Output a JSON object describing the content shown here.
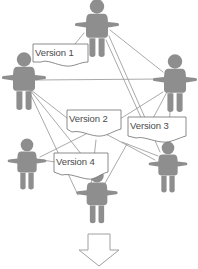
{
  "diagram": {
    "background_color": "#ffffff",
    "person_color": "#8e8e8e",
    "line_color": "#9a9a9a",
    "callout_fill": "#ffffff",
    "callout_stroke": "#6f6f6f",
    "text_color": "#4a4a4a",
    "arrow_fill": "#ffffff",
    "arrow_stroke": "#a0a0a0"
  },
  "callouts": [
    {
      "id": "version-1",
      "label": "Version 1",
      "x": 33,
      "y": 44
    },
    {
      "id": "version-2",
      "label": "Version 2",
      "x": 67,
      "y": 117
    },
    {
      "id": "version-3",
      "label": "Version 3",
      "x": 128,
      "y": 124
    },
    {
      "id": "version-4",
      "label": "Version 4",
      "x": 54,
      "y": 160
    }
  ],
  "people": [
    {
      "id": "person-top",
      "name": "person-top",
      "cx": 97,
      "cy": 27
    },
    {
      "id": "person-left-upper",
      "name": "person-left-upper",
      "cx": 24,
      "cy": 80
    },
    {
      "id": "person-right-upper",
      "name": "person-right-upper",
      "cx": 175,
      "cy": 82
    },
    {
      "id": "person-left-lower",
      "name": "person-left-lower",
      "cx": 27,
      "cy": 163
    },
    {
      "id": "person-right-lower",
      "name": "person-right-lower",
      "cx": 168,
      "cy": 166
    },
    {
      "id": "person-bottom",
      "name": "person-bottom",
      "cx": 97,
      "cy": 195
    }
  ],
  "flow_arrow": {
    "id": "down-arrow",
    "label": "downward flow arrow",
    "direction": "down"
  }
}
